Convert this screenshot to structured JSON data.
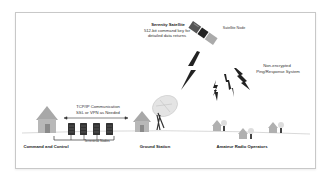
{
  "diagram": {
    "satellite": {
      "title": "Serenity Satellite",
      "line1": "512-bit command key for",
      "line2": "detailed data returns",
      "node_label": "Satellite Node"
    },
    "non_encrypted": {
      "line1": "Non-encrypted",
      "line2": "Ping/Response System"
    },
    "tcpip": {
      "line1": "TCP/IP Communication",
      "line2": "SSL or VPN as Needed"
    },
    "terrestrial_nodes_label": "Terrestrial Nodes",
    "command_and_control_label": "Command and Control",
    "ground_station_label": "Ground Station",
    "amateur_radio_label": "Amateur Radio Operators"
  },
  "colors": {
    "frame_border": "#c8c8c8",
    "house": "#9a9a9a",
    "server": "#333333",
    "lightning": "#222222",
    "ground_line": "#cccccc"
  }
}
